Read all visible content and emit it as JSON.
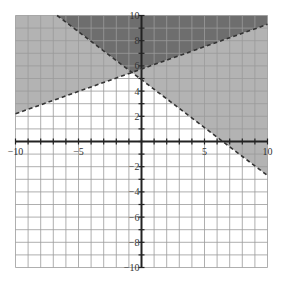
{
  "chart_data": {
    "type": "line",
    "title": "",
    "xlabel": "",
    "ylabel": "",
    "xlim": [
      -10,
      10
    ],
    "ylim": [
      -10,
      10
    ],
    "grid": true,
    "grid_step": 1,
    "x_tick_labels": [
      "-10",
      "-5",
      "5",
      "10"
    ],
    "x_tick_values": [
      -10,
      -5,
      5,
      10
    ],
    "y_tick_labels": [
      "10",
      "8",
      "6",
      "4",
      "2",
      "-2",
      "-4",
      "-6",
      "-8",
      "-10"
    ],
    "y_tick_values": [
      10,
      8,
      6,
      4,
      2,
      -2,
      -4,
      -6,
      -8,
      -10
    ],
    "series": [
      {
        "name": "boundary-increasing",
        "style": "dashed",
        "points": [
          [
            -10,
            2.2
          ],
          [
            10,
            9.3
          ]
        ]
      },
      {
        "name": "boundary-decreasing",
        "style": "dashed",
        "points": [
          [
            -6.7,
            10
          ],
          [
            10,
            -2.7
          ]
        ]
      }
    ],
    "regions": [
      {
        "name": "above-both",
        "shade": "dark",
        "color": "#6e6e6e"
      },
      {
        "name": "above-increasing-below-decreasing",
        "shade": "medium",
        "color": "#b3b3b3"
      },
      {
        "name": "below-increasing-above-decreasing",
        "shade": "medium",
        "color": "#b3b3b3"
      },
      {
        "name": "below-both",
        "shade": "none",
        "color": "#ffffff"
      }
    ]
  },
  "colors": {
    "dark": "#6e6e6e",
    "medium": "#b3b3b3",
    "grid": "#9a9a9a",
    "axis": "#222222",
    "line": "#333333"
  }
}
